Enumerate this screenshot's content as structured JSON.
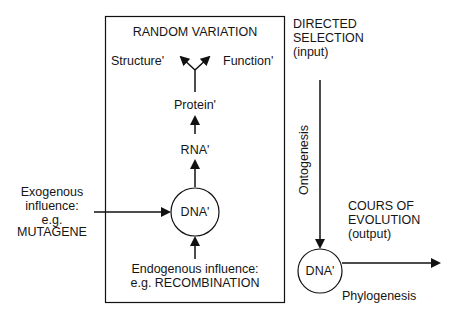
{
  "random_variation": {
    "title": "RANDOM VARIATION",
    "structure_label": "Structure'",
    "function_label": "Function'",
    "protein_label": "Protein'",
    "rna_label": "RNA'",
    "dna_label": "DNA'",
    "endogenous": {
      "line1": "Endogenous influence:",
      "line2": "e.g. RECOMBINATION"
    }
  },
  "exogenous": {
    "line1": "Exogenous",
    "line2": "influence:",
    "line3": "e.g.",
    "line4": "MUTAGENE"
  },
  "directed_selection": {
    "line1": "DIRECTED",
    "line2": "SELECTION",
    "line3": "(input)"
  },
  "ontogenesis_label": "Ontogenesis",
  "output": {
    "line1": "COURS OF",
    "line2": "EVOLUTION",
    "line3": "(output)",
    "dna_label": "DNA'",
    "phylogenesis_label": "Phylogenesis"
  },
  "colors": {
    "stroke": "#111111",
    "background": "#ffffff"
  }
}
